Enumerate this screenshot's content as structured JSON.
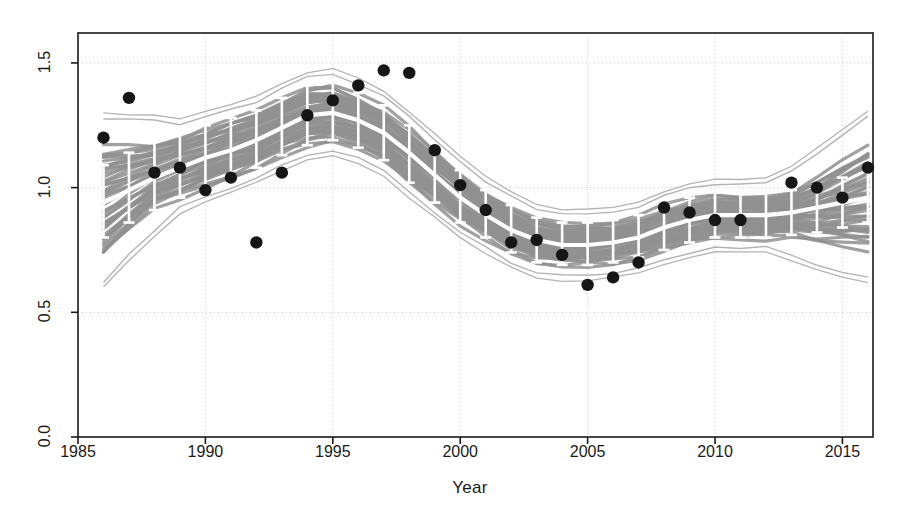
{
  "chart_data": {
    "type": "line",
    "title": "",
    "xlabel": "Year",
    "ylabel": "CPUE",
    "xlim": [
      1985,
      2016.2
    ],
    "ylim": [
      0.0,
      1.62
    ],
    "xticks": [
      1985,
      1990,
      1995,
      2000,
      2005,
      2010,
      2015
    ],
    "yticks": [
      0.0,
      0.5,
      1.0,
      1.5
    ],
    "ytick_labels": [
      "0.0",
      "0.5",
      "1.0",
      "1.5"
    ],
    "xtick_labels": [
      "1985",
      "1990",
      "1995",
      "2000",
      "2005",
      "2010",
      "2015"
    ],
    "grid": true,
    "grid_style": "dotted",
    "legend": "none",
    "x": [
      1986,
      1987,
      1988,
      1989,
      1990,
      1991,
      1992,
      1993,
      1994,
      1995,
      1996,
      1997,
      1998,
      1999,
      2000,
      2001,
      2002,
      2003,
      2004,
      2005,
      2006,
      2007,
      2008,
      2009,
      2010,
      2011,
      2012,
      2013,
      2014,
      2015,
      2016
    ],
    "series": [
      {
        "name": "Model predicted CPUE (median)",
        "style": "white-line",
        "values": [
          0.94,
          0.99,
          1.04,
          1.08,
          1.12,
          1.15,
          1.19,
          1.24,
          1.29,
          1.3,
          1.27,
          1.22,
          1.14,
          1.05,
          0.96,
          0.89,
          0.83,
          0.79,
          0.77,
          0.77,
          0.78,
          0.8,
          0.84,
          0.87,
          0.89,
          0.89,
          0.89,
          0.9,
          0.92,
          0.94,
          0.96
        ]
      },
      {
        "name": "95% credible interval (error bars)",
        "style": "error-bars",
        "lower": [
          0.8,
          0.86,
          0.91,
          0.96,
          1.0,
          1.04,
          1.08,
          1.13,
          1.17,
          1.19,
          1.16,
          1.11,
          1.02,
          0.94,
          0.86,
          0.8,
          0.74,
          0.7,
          0.69,
          0.69,
          0.7,
          0.72,
          0.75,
          0.78,
          0.8,
          0.8,
          0.8,
          0.81,
          0.82,
          0.84,
          0.86
        ],
        "upper": [
          1.09,
          1.14,
          1.19,
          1.22,
          1.25,
          1.28,
          1.31,
          1.36,
          1.41,
          1.42,
          1.38,
          1.33,
          1.25,
          1.16,
          1.07,
          0.99,
          0.93,
          0.88,
          0.86,
          0.86,
          0.87,
          0.89,
          0.93,
          0.96,
          0.98,
          0.98,
          0.98,
          0.99,
          1.01,
          1.04,
          1.07
        ]
      },
      {
        "name": "Bootstrap replicate band (grey envelope)",
        "style": "grey-band",
        "lower": [
          0.82,
          0.88,
          0.93,
          0.97,
          1.01,
          1.05,
          1.09,
          1.14,
          1.18,
          1.2,
          1.17,
          1.12,
          1.03,
          0.95,
          0.87,
          0.81,
          0.75,
          0.71,
          0.7,
          0.7,
          0.71,
          0.73,
          0.76,
          0.79,
          0.81,
          0.81,
          0.81,
          0.82,
          0.83,
          0.85,
          0.87
        ],
        "upper": [
          1.07,
          1.12,
          1.17,
          1.2,
          1.23,
          1.26,
          1.29,
          1.34,
          1.39,
          1.4,
          1.36,
          1.31,
          1.23,
          1.14,
          1.05,
          0.97,
          0.91,
          0.86,
          0.84,
          0.84,
          0.85,
          0.87,
          0.91,
          0.94,
          0.96,
          0.96,
          0.96,
          0.97,
          0.99,
          1.02,
          1.05
        ]
      },
      {
        "name": "Observed CPUE (filled circles)",
        "style": "points",
        "values": [
          1.2,
          1.36,
          1.06,
          1.08,
          0.99,
          1.04,
          0.78,
          1.06,
          1.29,
          1.35,
          1.41,
          1.47,
          1.46,
          1.15,
          1.01,
          0.91,
          0.78,
          0.79,
          0.73,
          0.61,
          0.64,
          0.7,
          0.92,
          0.9,
          0.87,
          0.87,
          null,
          1.02,
          1.0,
          0.96,
          1.08
        ]
      }
    ]
  },
  "axes": {
    "y_title": "CPUE",
    "x_title": "Year"
  }
}
